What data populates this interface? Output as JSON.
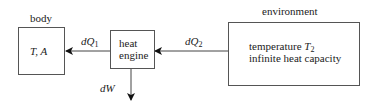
{
  "diagram": {
    "body": {
      "title": "body",
      "content": "T, A"
    },
    "engine": {
      "line1": "heat",
      "line2": "engine"
    },
    "environment": {
      "title": "environment",
      "line1_text": "temperature ",
      "line1_var": "T",
      "line1_sub": "2",
      "line2": "infinite heat capacity"
    },
    "flows": {
      "q1_var": "dQ",
      "q1_sub": "1",
      "q2_var": "dQ",
      "q2_sub": "2",
      "work": "dW"
    }
  }
}
